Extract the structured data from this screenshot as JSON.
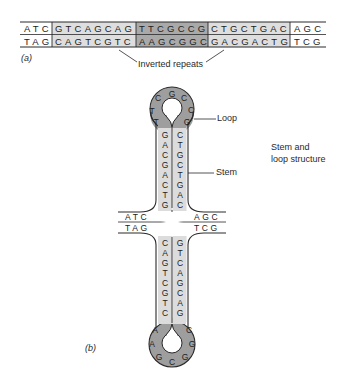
{
  "part_a": {
    "label": "(a)",
    "annotation": "Inverted repeats",
    "segments": [
      {
        "top": "ATC",
        "bottom": "TAG",
        "shade": "none"
      },
      {
        "top": "GTCAGCAG",
        "bottom": "CAGTCGTC",
        "shade": "light"
      },
      {
        "top": "TTCGCCG",
        "bottom": "AAGCGGC",
        "shade": "dark"
      },
      {
        "top": "CTGCTGAC",
        "bottom": "GACGACTG",
        "shade": "light"
      },
      {
        "top": "AGC",
        "bottom": "TCG",
        "shade": "none"
      }
    ]
  },
  "part_b": {
    "label": "(b)",
    "loop_label": "Loop",
    "stem_label": "Stem",
    "structure_label_line1": "Stem and",
    "structure_label_line2": "loop structure",
    "top_hairpin": {
      "loop_bases": [
        "T",
        "C",
        "G",
        "C",
        "C",
        "G"
      ],
      "loop_bases_left_first": "T",
      "left_stem": [
        "G",
        "A",
        "C",
        "G",
        "A",
        "C",
        "T",
        "G"
      ],
      "right_stem": [
        "C",
        "T",
        "G",
        "C",
        "T",
        "G",
        "A",
        "C"
      ],
      "loop_full": [
        "T",
        "T",
        "C",
        "G",
        "C",
        "C",
        "G"
      ]
    },
    "flank_top_left": "ATC",
    "flank_top_right": "AGC",
    "flank_bottom_left": "TAG",
    "flank_bottom_right": "TCG",
    "bottom_hairpin": {
      "left_stem": [
        "C",
        "A",
        "G",
        "T",
        "C",
        "G",
        "T",
        "C"
      ],
      "right_stem": [
        "G",
        "T",
        "C",
        "A",
        "G",
        "C",
        "A",
        "G"
      ],
      "loop_full": [
        "A",
        "A",
        "G",
        "C",
        "G",
        "G",
        "C"
      ]
    }
  },
  "colors": {
    "light_shade": "#d9d9d9",
    "dark_shade": "#a8a8a8",
    "loop_shade": "#9e9e9e",
    "stroke": "#2a2a2a"
  }
}
